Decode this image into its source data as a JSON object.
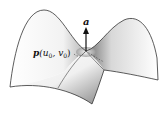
{
  "figure": {
    "type": "saddle-surface-diagram",
    "normal_vector_label": "a",
    "point_label": {
      "main": "p",
      "args": "(u",
      "sub0": "0",
      "comma": ", v",
      "sub1": "0",
      "close": ")"
    },
    "colors": {
      "outline": "#333333",
      "shade_dark": "#6a6a6a",
      "surface": "#ffffff"
    }
  }
}
